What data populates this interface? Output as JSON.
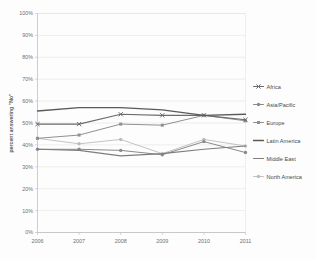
{
  "chart_data": {
    "type": "line",
    "title": "",
    "subtitle": "",
    "xlabel": "",
    "ylabel": "percent answering \"No\"",
    "x": [
      2006,
      2007,
      2008,
      2009,
      2010,
      2011
    ],
    "xtick_labels": [
      "2006",
      "2007",
      "2008",
      "2009",
      "2010",
      "2011"
    ],
    "ytick_labels": [
      "0%",
      "10%",
      "20%",
      "30%",
      "40%",
      "50%",
      "60%",
      "70%",
      "80%",
      "90%",
      "100%"
    ],
    "ytick_values": [
      0,
      10,
      20,
      30,
      40,
      50,
      60,
      70,
      80,
      90,
      100
    ],
    "ylim": [
      0,
      100
    ],
    "xlim": [
      2006,
      2011
    ],
    "grid": "horizontal",
    "legend_position": "right",
    "series": [
      {
        "name": "Africa",
        "values": [
          49.5,
          49.5,
          54.0,
          53.5,
          53.5,
          51.5
        ],
        "color": "#6b6b6b",
        "marker": "x",
        "line_width": 1.1
      },
      {
        "name": "Asia/Pacific",
        "values": [
          38.0,
          38.0,
          37.5,
          35.5,
          41.5,
          36.5
        ],
        "color": "#8a8a8a",
        "marker": "circle",
        "line_width": 1.0
      },
      {
        "name": "Europe",
        "values": [
          43.0,
          44.5,
          49.5,
          49.0,
          53.5,
          51.0
        ],
        "color": "#909090",
        "marker": "square",
        "line_width": 1.0
      },
      {
        "name": "Latin America",
        "values": [
          55.5,
          57.0,
          57.0,
          56.0,
          53.5,
          54.0
        ],
        "color": "#5a5a5a",
        "marker": "none",
        "line_width": 1.4
      },
      {
        "name": "Middle East",
        "values": [
          38.0,
          37.5,
          35.0,
          36.0,
          38.0,
          39.5
        ],
        "color": "#7d7d7d",
        "marker": "none",
        "line_width": 1.1
      },
      {
        "name": "North America",
        "values": [
          43.0,
          40.5,
          42.5,
          36.0,
          42.5,
          39.5
        ],
        "color": "#bcbcbc",
        "marker": "circle",
        "line_width": 0.9
      }
    ]
  },
  "style": {
    "background": "#fdfdfd",
    "gridline_color": "#e2e2e2",
    "axis_color": "#b8b8b8",
    "tick_text_color": "#6f6f6f",
    "legend_text_color": "#4a4a4a"
  }
}
